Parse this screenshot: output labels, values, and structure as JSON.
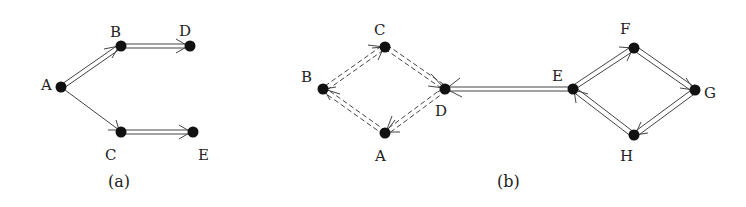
{
  "figure": {
    "panels": [
      {
        "caption": "(a)",
        "nodes": [
          {
            "id": "A",
            "label": "A",
            "x": 61,
            "y": 87,
            "lx": 47,
            "ly": 82
          },
          {
            "id": "B",
            "label": "B",
            "x": 121,
            "y": 46,
            "lx": 116,
            "ly": 34
          },
          {
            "id": "D",
            "label": "D",
            "x": 190,
            "y": 46,
            "lx": 185,
            "ly": 32
          },
          {
            "id": "C",
            "label": "C",
            "x": 121,
            "y": 132,
            "lx": 114,
            "ly": 158
          },
          {
            "id": "E",
            "label": "E",
            "x": 193,
            "y": 132,
            "lx": 200,
            "ly": 158
          }
        ],
        "edges": [
          {
            "from": "A",
            "to": "B",
            "style": "double"
          },
          {
            "from": "B",
            "to": "D",
            "style": "double"
          },
          {
            "from": "A",
            "to": "C",
            "style": "single"
          },
          {
            "from": "C",
            "to": "E",
            "style": "double"
          }
        ]
      },
      {
        "caption": "(b)",
        "nodes": [
          {
            "id": "C",
            "label": "C",
            "x": 385,
            "y": 47,
            "lx": 380,
            "ly": 33
          },
          {
            "id": "B",
            "label": "B",
            "x": 323,
            "y": 89,
            "lx": 305,
            "ly": 83
          },
          {
            "id": "D",
            "label": "D",
            "x": 445,
            "y": 89,
            "lx": 441,
            "ly": 119
          },
          {
            "id": "A",
            "label": "A",
            "x": 385,
            "y": 133,
            "lx": 380,
            "ly": 159
          },
          {
            "id": "E",
            "label": "E",
            "x": 573,
            "y": 89,
            "lx": 555,
            "ly": 80
          },
          {
            "id": "F",
            "label": "F",
            "x": 634,
            "y": 48,
            "lx": 625,
            "ly": 33
          },
          {
            "id": "G",
            "label": "G",
            "x": 695,
            "y": 90,
            "lx": 706,
            "ly": 99
          },
          {
            "id": "H",
            "label": "H",
            "x": 634,
            "y": 135,
            "lx": 626,
            "ly": 161
          }
        ],
        "edges": [
          {
            "from": "A",
            "to": "B",
            "style": "dashed-double"
          },
          {
            "from": "B",
            "to": "C",
            "style": "dashed-double"
          },
          {
            "from": "C",
            "to": "D",
            "style": "dashed-double"
          },
          {
            "from": "D",
            "to": "A",
            "style": "dashed-double"
          },
          {
            "from": "E",
            "to": "D",
            "style": "double"
          },
          {
            "from": "E",
            "to": "F",
            "style": "double"
          },
          {
            "from": "F",
            "to": "G",
            "style": "double"
          },
          {
            "from": "G",
            "to": "H",
            "style": "double"
          },
          {
            "from": "H",
            "to": "E",
            "style": "double"
          }
        ]
      }
    ],
    "captions": {
      "a": "(a)",
      "b": "(b)"
    },
    "labels_a": {
      "A": "A",
      "B": "B",
      "C": "C",
      "D": "D",
      "E": "E"
    },
    "labels_b": {
      "A": "A",
      "B": "B",
      "C": "C",
      "D": "D",
      "E": "E",
      "F": "F",
      "G": "G",
      "H": "H"
    }
  }
}
